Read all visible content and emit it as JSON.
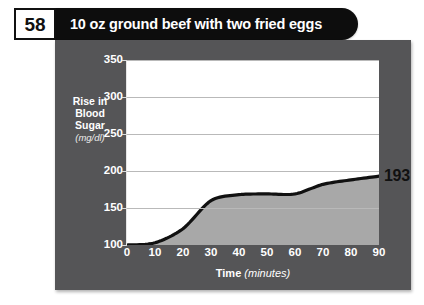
{
  "header": {
    "page_number": "58",
    "title": "10 oz ground beef with two fried eggs"
  },
  "chart_data": {
    "type": "area",
    "title": "10 oz ground beef with two fried eggs",
    "xlabel_main": "Time",
    "xlabel_unit": "(minutes)",
    "ylabel_main": "Rise in Blood Sugar",
    "ylabel_line1": "Rise in",
    "ylabel_line2": "Blood",
    "ylabel_line3": "Sugar",
    "ylabel_unit": "(mg/dl)",
    "x": [
      0,
      10,
      20,
      30,
      40,
      50,
      60,
      70,
      80,
      90
    ],
    "values": [
      100,
      103,
      122,
      160,
      168,
      169,
      169,
      182,
      188,
      193
    ],
    "xticks": [
      "0",
      "10",
      "20",
      "30",
      "40",
      "50",
      "60",
      "70",
      "80",
      "90"
    ],
    "yticks": [
      "100",
      "150",
      "200",
      "250",
      "300",
      "350"
    ],
    "xlim": [
      0,
      90
    ],
    "ylim": [
      100,
      350
    ],
    "grid": true,
    "legend": "none",
    "end_label": "193",
    "series_name": "Rise in Blood Sugar",
    "colors": {
      "panel": "#555557",
      "plot_background": "#ffffff",
      "area_fill": "#a8a8a8",
      "line": "#111111",
      "gridline": "#b9b9b9",
      "title_bar": "#0d0d0d",
      "tick_text": "#ffffff"
    }
  }
}
